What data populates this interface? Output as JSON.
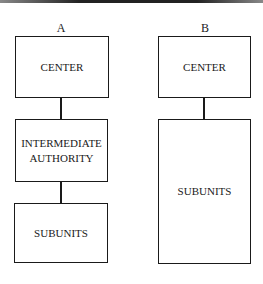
{
  "diagram": {
    "columns": [
      {
        "label": "A",
        "boxes": [
          {
            "text": "CENTER"
          },
          {
            "text": "INTERMEDIATE AUTHORITY"
          },
          {
            "text": "SUBUNITS"
          }
        ]
      },
      {
        "label": "B",
        "boxes": [
          {
            "text": "CENTER"
          },
          {
            "text": "SUBUNITS"
          }
        ]
      }
    ],
    "connections": [
      {
        "from": "A.CENTER",
        "to": "A.INTERMEDIATE AUTHORITY"
      },
      {
        "from": "A.INTERMEDIATE AUTHORITY",
        "to": "A.SUBUNITS"
      },
      {
        "from": "B.CENTER",
        "to": "B.SUBUNITS"
      }
    ]
  }
}
